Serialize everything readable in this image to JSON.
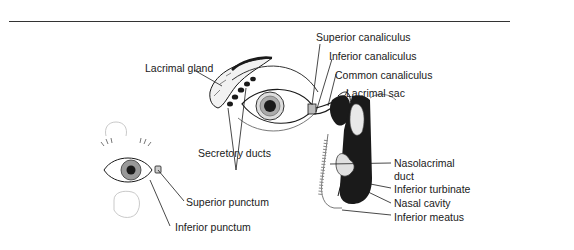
{
  "diagram": {
    "labels": {
      "lacrimal_gland": "Lacrimal gland",
      "secretory_ducts": "Secretory ducts",
      "superior_canaliculus": "Superior canaliculus",
      "inferior_canaliculus": "Inferior canaliculus",
      "common_canaliculus": "Common canaliculus",
      "lacrimal_sac": "Lacrimal sac",
      "nasolacrimal_duct_line1": "Nasolacrimal",
      "nasolacrimal_duct_line2": "duct",
      "inferior_turbinate": "Inferior turbinate",
      "nasal_cavity": "Nasal cavity",
      "inferior_meatus": "Inferior meatus",
      "superior_punctum": "Superior punctum",
      "inferior_punctum": "Inferior punctum"
    },
    "colors": {
      "ink": "#1a1a1a",
      "background": "#ffffff",
      "shade": "#777777"
    }
  }
}
